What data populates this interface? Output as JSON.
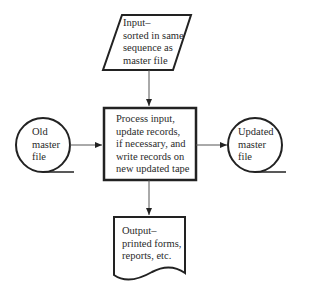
{
  "nodes": {
    "input": {
      "shape": "parallelogram",
      "lines": [
        "Input–",
        "sorted in same",
        "sequence as",
        "master file"
      ]
    },
    "process": {
      "shape": "rectangle",
      "lines": [
        "Process input,",
        "update records,",
        "if necessary, and",
        "write records on",
        "new updated tape"
      ]
    },
    "old_master": {
      "shape": "magnetic-tape",
      "lines": [
        "Old",
        "master",
        "file"
      ]
    },
    "updated_master": {
      "shape": "magnetic-tape",
      "lines": [
        "Updated",
        "master",
        "file"
      ]
    },
    "output": {
      "shape": "document",
      "lines": [
        "Output–",
        "printed forms,",
        "reports, etc."
      ]
    }
  },
  "edges": [
    {
      "from": "input",
      "to": "process"
    },
    {
      "from": "old_master",
      "to": "process"
    },
    {
      "from": "process",
      "to": "updated_master"
    },
    {
      "from": "process",
      "to": "output"
    }
  ],
  "colors": {
    "stroke": "#222222",
    "background": "#ffffff"
  }
}
